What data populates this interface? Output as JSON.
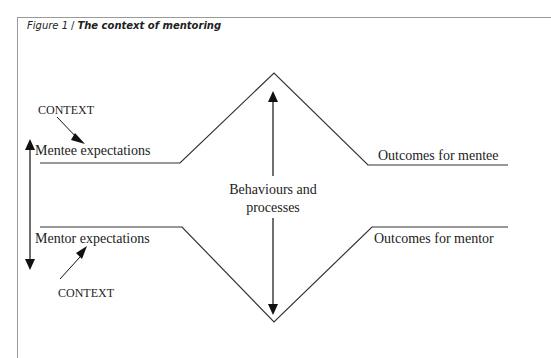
{
  "figure": {
    "number_label": "Figure 1",
    "separator": "/",
    "title": "The context of mentoring"
  },
  "diagram": {
    "context_top": "CONTEXT",
    "context_bottom": "CONTEXT",
    "mentee_expectations": "Mentee expectations",
    "mentor_expectations": "Mentor expectations",
    "center_line1": "Behaviours and",
    "center_line2": "processes",
    "outcomes_mentee": "Outcomes for mentee",
    "outcomes_mentor": "Outcomes for mentor"
  }
}
